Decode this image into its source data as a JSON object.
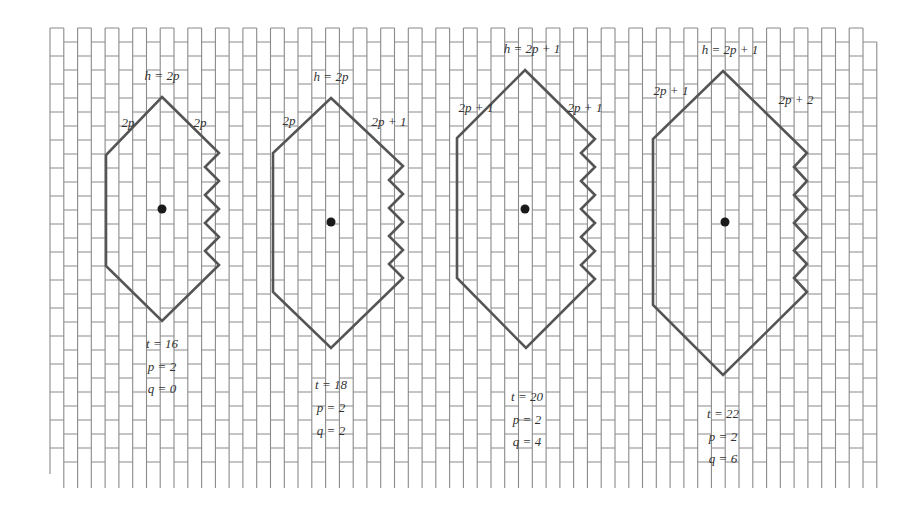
{
  "diagram": {
    "colors": {
      "background": "#ffffff",
      "grid_line": "#8a8a8a",
      "outline": "#555555",
      "dot": "#1a1a1a",
      "text": "#333333"
    },
    "grid": {
      "x_start": 50,
      "x_end": 877,
      "column_width": 13.78,
      "brick_height": 28,
      "even_top": 28,
      "even_bottom": 474,
      "odd_top": 42,
      "odd_bottom": 488
    },
    "shapes": [
      {
        "id": "hex-1",
        "top_label": "h = 2p",
        "left_label": "2p",
        "right_label": "2p",
        "params": {
          "t": "t = 16",
          "p": "p = 2",
          "q": "q = 0"
        },
        "top": [
          162,
          97
        ],
        "left_x": 106,
        "left_top_y": 155,
        "left_bottom_y": 266,
        "bottom": [
          162,
          321
        ],
        "right_peak_x": 219,
        "right_valley_x": 205,
        "right_peaks_y": [
          153,
          181,
          209,
          237,
          265
        ],
        "dot": [
          162,
          209
        ],
        "label_positions": {
          "top": [
            162,
            80
          ],
          "left": [
            128,
            127
          ],
          "right": [
            200,
            127
          ],
          "params_x": 162,
          "params_y": [
            348,
            371,
            393
          ]
        }
      },
      {
        "id": "hex-2",
        "top_label": "h = 2p",
        "left_label": "2p",
        "right_label": "2p + 1",
        "params": {
          "t": "t = 18",
          "p": "p = 2",
          "q": "q = 2"
        },
        "top": [
          331,
          98
        ],
        "left_x": 273,
        "left_top_y": 153,
        "left_bottom_y": 292,
        "bottom": [
          331,
          348
        ],
        "right_peak_x": 403,
        "right_valley_x": 389,
        "right_peaks_y": [
          166,
          194,
          222,
          250,
          278
        ],
        "dot": [
          331,
          222
        ],
        "label_positions": {
          "top": [
            331,
            81
          ],
          "left": [
            289,
            125
          ],
          "right": [
            389,
            126
          ],
          "params_x": 331,
          "params_y": [
            389,
            412,
            435
          ]
        }
      },
      {
        "id": "hex-3",
        "top_label": "h = 2p + 1",
        "left_label": "2p + 1",
        "right_label": "2p + 1",
        "params": {
          "t": "t = 20",
          "p": "p = 2",
          "q": "q = 4"
        },
        "top": [
          525,
          70
        ],
        "left_x": 457,
        "left_top_y": 138,
        "left_bottom_y": 278,
        "bottom": [
          526,
          348
        ],
        "right_peak_x": 595,
        "right_valley_x": 581,
        "right_peaks_y": [
          139,
          167,
          195,
          223,
          251,
          279
        ],
        "dot": [
          525,
          209
        ],
        "label_positions": {
          "top": [
            532,
            53
          ],
          "left": [
            476,
            112
          ],
          "right": [
            585,
            112
          ],
          "params_x": 527,
          "params_y": [
            401,
            424,
            446
          ]
        }
      },
      {
        "id": "hex-4",
        "top_label": "h = 2p + 1",
        "left_label": "2p + 1",
        "right_label": "2p + 2",
        "params": {
          "t": "t = 22",
          "p": "p = 2",
          "q": "q = 6"
        },
        "top": [
          723,
          71
        ],
        "left_x": 653,
        "left_top_y": 139,
        "left_bottom_y": 305,
        "bottom": [
          723,
          375
        ],
        "right_peak_x": 807,
        "right_valley_x": 794,
        "right_peaks_y": [
          153,
          181,
          209,
          237,
          264,
          292
        ],
        "dot": [
          725,
          222
        ],
        "label_positions": {
          "top": [
            730,
            54
          ],
          "left": [
            671,
            95
          ],
          "right": [
            796,
            104
          ],
          "params_x": 723,
          "params_y": [
            418,
            441,
            463
          ]
        }
      }
    ]
  }
}
